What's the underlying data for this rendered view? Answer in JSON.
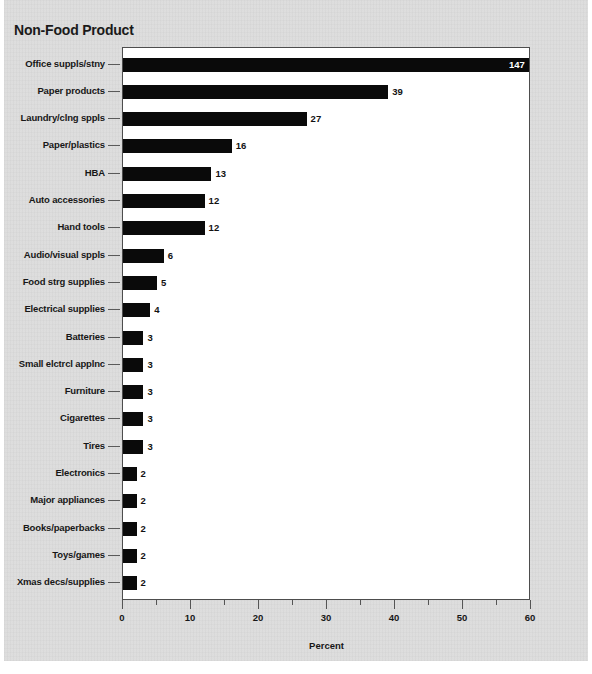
{
  "chart_data": {
    "type": "bar",
    "orientation": "horizontal",
    "title": "Non-Food Product",
    "xlabel": "Percent",
    "ylabel": "",
    "xlim": [
      0,
      60
    ],
    "xticks": [
      0,
      10,
      20,
      30,
      40,
      50,
      60
    ],
    "xtick_labels": [
      "0",
      "10",
      "20",
      "30",
      "40",
      "50",
      "60"
    ],
    "xminor_ticks": [
      5,
      15,
      25,
      35,
      45,
      55
    ],
    "grid": false,
    "legend": null,
    "bar_color": "#0a0a0a",
    "categories": [
      "Office suppls/stny",
      "Paper products",
      "Laundry/clng sppls",
      "Paper/plastics",
      "HBA",
      "Auto accessories",
      "Hand tools",
      "Audio/visual sppls",
      "Food strg supplies",
      "Electrical supplies",
      "Batteries",
      "Small elctrcl applnc",
      "Furniture",
      "Cigarettes",
      "Tires",
      "Electronics",
      "Major appliances",
      "Books/paperbacks",
      "Toys/games",
      "Xmas decs/supplies"
    ],
    "values": [
      147,
      39,
      27,
      16,
      13,
      12,
      12,
      6,
      5,
      4,
      3,
      3,
      3,
      3,
      3,
      2,
      2,
      2,
      2,
      2
    ],
    "value_labels": [
      "147",
      "39",
      "27",
      "16",
      "13",
      "12",
      "12",
      "6",
      "5",
      "4",
      "3",
      "3",
      "3",
      "3",
      "3",
      "2",
      "2",
      "2",
      "2",
      "2"
    ]
  }
}
